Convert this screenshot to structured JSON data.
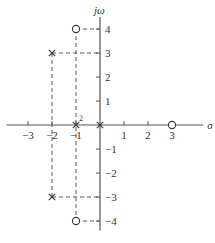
{
  "diagram": {
    "type": "pole-zero-plot",
    "x_axis_label": "σ",
    "y_axis_label": "jω",
    "x_ticks": [
      {
        "value": -3,
        "label": "−3"
      },
      {
        "value": -2,
        "label": "−2"
      },
      {
        "value": -1,
        "label": "−1"
      },
      {
        "value": 1,
        "label": "1"
      },
      {
        "value": 2,
        "label": "2"
      },
      {
        "value": 3,
        "label": "3"
      }
    ],
    "y_ticks": [
      {
        "value": 4,
        "label": "4"
      },
      {
        "value": 3,
        "label": "3"
      },
      {
        "value": 2,
        "label": "2"
      },
      {
        "value": 1,
        "label": "1"
      },
      {
        "value": -1,
        "label": "−1"
      },
      {
        "value": -2,
        "label": "−2"
      },
      {
        "value": -3,
        "label": "−3"
      },
      {
        "value": -4,
        "label": "−4"
      }
    ],
    "x_range": [
      -3.9,
      4.3
    ],
    "y_range": [
      -4.4,
      4.5
    ],
    "poles": [
      {
        "re": -2,
        "im": 3,
        "multiplicity": 1
      },
      {
        "re": -2,
        "im": -3,
        "multiplicity": 1
      },
      {
        "re": -1,
        "im": 0,
        "multiplicity": 2,
        "multiplicity_label": "2"
      },
      {
        "re": 0,
        "im": 0,
        "multiplicity": 1
      }
    ],
    "zeros": [
      {
        "re": -1,
        "im": 4
      },
      {
        "re": -1,
        "im": -4
      },
      {
        "re": 3,
        "im": 0
      }
    ],
    "guide_lines": [
      {
        "from": [
          -2,
          3
        ],
        "to": [
          0,
          3
        ]
      },
      {
        "from": [
          -2,
          -3
        ],
        "to": [
          0,
          -3
        ]
      },
      {
        "from": [
          -2,
          3
        ],
        "to": [
          -2,
          -3
        ]
      },
      {
        "from": [
          -1,
          4
        ],
        "to": [
          0,
          4
        ]
      },
      {
        "from": [
          -1,
          -4
        ],
        "to": [
          0,
          -4
        ]
      },
      {
        "from": [
          -1,
          4
        ],
        "to": [
          -1,
          -4
        ]
      }
    ]
  }
}
